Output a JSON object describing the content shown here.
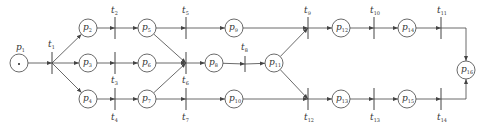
{
  "diagram": {
    "type": "petri-net",
    "places": [
      {
        "id": "p1",
        "label": "p",
        "sub": "1",
        "x": 19,
        "y": 63,
        "token": true,
        "lx": 16,
        "ly": 50
      },
      {
        "id": "p2",
        "label": "p",
        "sub": "2",
        "x": 88,
        "y": 28
      },
      {
        "id": "p3",
        "label": "p",
        "sub": "3",
        "x": 88,
        "y": 63
      },
      {
        "id": "p4",
        "label": "p",
        "sub": "4",
        "x": 88,
        "y": 99
      },
      {
        "id": "p5",
        "label": "p",
        "sub": "5",
        "x": 147,
        "y": 28
      },
      {
        "id": "p6",
        "label": "p",
        "sub": "6",
        "x": 147,
        "y": 63
      },
      {
        "id": "p7",
        "label": "p",
        "sub": "7",
        "x": 147,
        "y": 99
      },
      {
        "id": "p8",
        "label": "p",
        "sub": "8",
        "x": 214,
        "y": 63
      },
      {
        "id": "p9",
        "label": "p",
        "sub": "9",
        "x": 234,
        "y": 28
      },
      {
        "id": "p10",
        "label": "p",
        "sub": "10",
        "x": 234,
        "y": 99
      },
      {
        "id": "p11",
        "label": "p",
        "sub": "11",
        "x": 274,
        "y": 63
      },
      {
        "id": "p12",
        "label": "p",
        "sub": "12",
        "x": 341,
        "y": 28
      },
      {
        "id": "p13",
        "label": "p",
        "sub": "13",
        "x": 341,
        "y": 99
      },
      {
        "id": "p14",
        "label": "p",
        "sub": "14",
        "x": 407,
        "y": 28
      },
      {
        "id": "p15",
        "label": "p",
        "sub": "15",
        "x": 407,
        "y": 99
      },
      {
        "id": "p16",
        "label": "p",
        "sub": "16",
        "x": 466,
        "y": 70
      }
    ],
    "transitions": [
      {
        "id": "t1",
        "label": "t",
        "sub": "1",
        "x": 52,
        "y1": 52,
        "y2": 74,
        "lx": 48,
        "ly": 47
      },
      {
        "id": "t2",
        "label": "t",
        "sub": "2",
        "x": 115,
        "y1": 17,
        "y2": 39,
        "lx": 111,
        "ly": 13
      },
      {
        "id": "t3",
        "label": "t",
        "sub": "3",
        "x": 115,
        "y1": 52,
        "y2": 74,
        "lx": 111,
        "ly": 83
      },
      {
        "id": "t4",
        "label": "t",
        "sub": "4",
        "x": 115,
        "y1": 88,
        "y2": 110,
        "lx": 111,
        "ly": 120
      },
      {
        "id": "t5",
        "label": "t",
        "sub": "5",
        "x": 186,
        "y1": 17,
        "y2": 39,
        "lx": 182,
        "ly": 13
      },
      {
        "id": "t6",
        "label": "t",
        "sub": "6",
        "x": 186,
        "y1": 52,
        "y2": 74,
        "lx": 182,
        "ly": 83
      },
      {
        "id": "t7",
        "label": "t",
        "sub": "7",
        "x": 186,
        "y1": 88,
        "y2": 110,
        "lx": 182,
        "ly": 120
      },
      {
        "id": "t8",
        "label": "t",
        "sub": "8",
        "x": 245,
        "y1": 56,
        "y2": 72,
        "lx": 241,
        "ly": 50
      },
      {
        "id": "t9",
        "label": "t",
        "sub": "9",
        "x": 308,
        "y1": 17,
        "y2": 39,
        "lx": 304,
        "ly": 13
      },
      {
        "id": "t10",
        "label": "t",
        "sub": "10",
        "x": 374,
        "y1": 17,
        "y2": 39,
        "lx": 370,
        "ly": 13
      },
      {
        "id": "t11",
        "label": "t",
        "sub": "11",
        "x": 441,
        "y1": 17,
        "y2": 39,
        "lx": 437,
        "ly": 13
      },
      {
        "id": "t12",
        "label": "t",
        "sub": "12",
        "x": 308,
        "y1": 88,
        "y2": 110,
        "lx": 304,
        "ly": 120
      },
      {
        "id": "t13",
        "label": "t",
        "sub": "13",
        "x": 374,
        "y1": 88,
        "y2": 110,
        "lx": 370,
        "ly": 120
      },
      {
        "id": "t14",
        "label": "t",
        "sub": "14",
        "x": 441,
        "y1": 88,
        "y2": 110,
        "lx": 437,
        "ly": 120
      }
    ],
    "arcs": [
      {
        "from": "p1",
        "to": "t1"
      },
      {
        "from": "t1",
        "to": "p2"
      },
      {
        "from": "t1",
        "to": "p3"
      },
      {
        "from": "t1",
        "to": "p4"
      },
      {
        "from": "p2",
        "to": "t2"
      },
      {
        "from": "p3",
        "to": "t3"
      },
      {
        "from": "p4",
        "to": "t4"
      },
      {
        "from": "t2",
        "to": "p5"
      },
      {
        "from": "t3",
        "to": "p6"
      },
      {
        "from": "t4",
        "to": "p7"
      },
      {
        "from": "p5",
        "to": "t5"
      },
      {
        "from": "p5",
        "to": "t6"
      },
      {
        "from": "p6",
        "to": "t6"
      },
      {
        "from": "p7",
        "to": "t6"
      },
      {
        "from": "p7",
        "to": "t7"
      },
      {
        "from": "t5",
        "to": "p9"
      },
      {
        "from": "t6",
        "to": "p8"
      },
      {
        "from": "t7",
        "to": "p10"
      },
      {
        "from": "p8",
        "to": "t8"
      },
      {
        "from": "t8",
        "to": "p11"
      },
      {
        "from": "p9",
        "to": "t9"
      },
      {
        "from": "p11",
        "to": "t9"
      },
      {
        "from": "p11",
        "to": "t12"
      },
      {
        "from": "p10",
        "to": "t12"
      },
      {
        "from": "t9",
        "to": "p12"
      },
      {
        "from": "t12",
        "to": "p13"
      },
      {
        "from": "p12",
        "to": "t10"
      },
      {
        "from": "p13",
        "to": "t13"
      },
      {
        "from": "t10",
        "to": "p14"
      },
      {
        "from": "t13",
        "to": "p15"
      },
      {
        "from": "p14",
        "to": "t11"
      },
      {
        "from": "p15",
        "to": "t14"
      },
      {
        "from": "t11",
        "to": "p16",
        "route": "elbow-down"
      },
      {
        "from": "t14",
        "to": "p16",
        "route": "elbow-up"
      }
    ],
    "colors": {
      "stroke": "#444444",
      "background": "#ffffff"
    }
  }
}
